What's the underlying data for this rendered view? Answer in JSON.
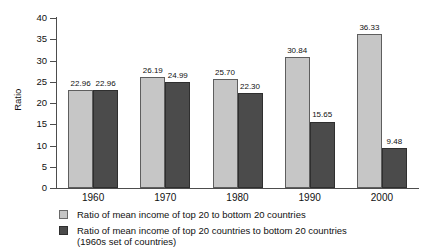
{
  "chart_data": {
    "type": "bar",
    "title": "",
    "subtitle": "",
    "xlabel": "",
    "ylabel": "Ratio",
    "ylim": [
      0,
      40
    ],
    "yticks": [
      0,
      5,
      10,
      15,
      20,
      25,
      30,
      35,
      40
    ],
    "ytick_labels": [
      "0",
      "5",
      "10",
      "15",
      "20",
      "25",
      "30",
      "35",
      "40"
    ],
    "grid": false,
    "legend_position": "bottom-left",
    "categories": [
      "1960",
      "1970",
      "1980",
      "1990",
      "2000"
    ],
    "series": [
      {
        "name": "Ratio of mean income of top 20 to bottom 20 countries",
        "color": "#c6c6c6",
        "values": [
          22.96,
          26.19,
          25.7,
          30.84,
          36.33
        ],
        "labels": [
          "22.96",
          "26.19",
          "25.70",
          "30.84",
          "36.33"
        ]
      },
      {
        "name": "Ratio of mean income of top 20 countries to bottom 20 countries",
        "name_sub": "(1960s set of countries)",
        "color": "#4b4b4b",
        "values": [
          22.96,
          24.99,
          22.3,
          15.65,
          9.48
        ],
        "labels": [
          "22.96",
          "24.99",
          "22.30",
          "15.65",
          "9.48"
        ]
      }
    ]
  },
  "axis": {
    "y_title": "Ratio"
  },
  "legend": {
    "items": [
      {
        "label": "Ratio of mean income of top 20 to bottom 20 countries",
        "sub": ""
      },
      {
        "label": "Ratio of mean income of top 20 countries to bottom 20 countries",
        "sub": "(1960s set of countries)"
      }
    ]
  },
  "colors": {
    "series_light": "#c6c6c6",
    "series_dark": "#4b4b4b",
    "axis": "#4d4d4d",
    "text": "#111111",
    "background": "#ffffff"
  }
}
